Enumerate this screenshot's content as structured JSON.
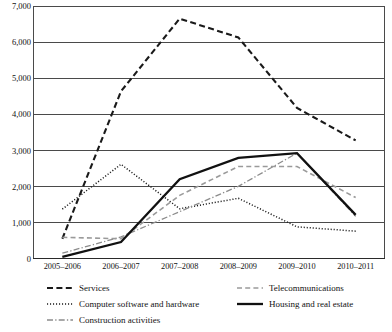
{
  "chart_data": {
    "type": "line",
    "title": "",
    "subtitle": "",
    "xlabel": "",
    "ylabel": "",
    "categories": [
      "2005–2006",
      "2006–2007",
      "2007–2008",
      "2008–2009",
      "2009–2010",
      "2010–2011"
    ],
    "ylim": [
      0,
      7000
    ],
    "ytick_values": [
      0,
      1000,
      2000,
      3000,
      4000,
      5000,
      6000,
      7000
    ],
    "ytick_labels": [
      "0",
      "1,000",
      "2,000",
      "3,000",
      "4,000",
      "5,000",
      "6,000",
      "7,000"
    ],
    "grid": "horizontal",
    "legend_position": "bottom",
    "series": [
      {
        "name": "Services",
        "style": "dashed-bold",
        "color": "#1a1a1a",
        "values": [
          560,
          4640,
          6650,
          6130,
          4180,
          3280
        ]
      },
      {
        "name": "Computer software and hardware",
        "style": "dotted",
        "color": "#1a1a1a",
        "values": [
          1380,
          2620,
          1390,
          1680,
          890,
          770
        ]
      },
      {
        "name": "Construction activities",
        "style": "dash-dot",
        "color": "#8c8c8c",
        "values": [
          160,
          610,
          1310,
          2010,
          2930,
          1180
        ]
      },
      {
        "name": "Telecommunications",
        "style": "dashed",
        "color": "#9a9a9a",
        "values": [
          600,
          560,
          1760,
          2560,
          2560,
          1700
        ]
      },
      {
        "name": "Housing and real estate",
        "style": "solid-bold",
        "color": "#111111",
        "values": [
          60,
          470,
          2210,
          2800,
          2930,
          1220
        ]
      }
    ]
  },
  "legend": {
    "entries": [
      {
        "label": "Services",
        "column": "a",
        "row": 0
      },
      {
        "label": "Computer software and hardware",
        "column": "a",
        "row": 1
      },
      {
        "label": "Construction activities",
        "column": "a",
        "row": 2
      },
      {
        "label": "Telecommunications",
        "column": "b",
        "row": 0
      },
      {
        "label": "Housing and real estate",
        "column": "b",
        "row": 1
      }
    ]
  }
}
